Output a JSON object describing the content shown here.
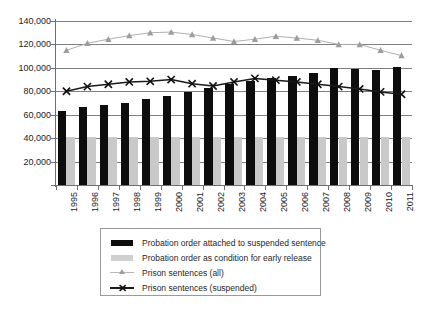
{
  "chart_data": {
    "type": "bar",
    "title": "",
    "subtitle": "",
    "xlabel": "",
    "ylabel": "",
    "ylim": [
      0,
      140000
    ],
    "ytick_step": 20000,
    "grid": true,
    "legend_position": "bottom",
    "categories": [
      "1995",
      "1996",
      "1997",
      "1998",
      "1999",
      "2000",
      "2001",
      "2002",
      "2003",
      "2004",
      "2005",
      "2006",
      "2007",
      "2008",
      "2009",
      "2010",
      "2011"
    ],
    "ytick_labels": [
      "140,000",
      "120,000",
      "100,000",
      "80,000",
      "60,000",
      "40,000",
      "20,000",
      ""
    ],
    "ytick_values": [
      140000,
      120000,
      100000,
      80000,
      60000,
      40000,
      20000,
      0
    ],
    "series": [
      {
        "name": "Probation order attached to suspended sentence",
        "kind": "bar",
        "color": "#0d0d0d",
        "values": [
          63000,
          66500,
          68000,
          70000,
          73500,
          76000,
          79000,
          83000,
          86000,
          89000,
          91000,
          93000,
          96000,
          100000,
          99000,
          98500,
          100500
        ]
      },
      {
        "name": "Probation order as condition for early release",
        "kind": "bar",
        "color": "#c9c9c9",
        "values": [
          41000,
          41000,
          41000,
          41000,
          41000,
          41000,
          41000,
          41000,
          41000,
          41000,
          41000,
          41000,
          41000,
          41000,
          41000,
          41000,
          41000
        ]
      },
      {
        "name": "Prison sentences (all)",
        "kind": "line",
        "marker": "triangle",
        "color": "#b0b0b0",
        "values": [
          115000,
          121000,
          124500,
          127500,
          130000,
          130500,
          128500,
          125500,
          122500,
          124500,
          127000,
          125500,
          123500,
          120000,
          120000,
          115000,
          110500
        ]
      },
      {
        "name": "Prison sentences (suspended)",
        "kind": "line",
        "marker": "x",
        "color": "#1a1a1a",
        "values": [
          80000,
          84000,
          86000,
          88000,
          88500,
          90000,
          86500,
          84500,
          88000,
          91000,
          89500,
          88000,
          86000,
          84000,
          82000,
          79500,
          77500
        ]
      }
    ]
  },
  "legend": {
    "items": [
      {
        "label": "Probation order attached to suspended sentence",
        "marker": "black-bar"
      },
      {
        "label": "Probation order as condition for early release",
        "marker": "gray-bar"
      },
      {
        "label": "Prison sentences (all)",
        "marker": "light-triangle-line"
      },
      {
        "label": "Prison sentences (suspended)",
        "marker": "dark-x-line"
      }
    ]
  }
}
